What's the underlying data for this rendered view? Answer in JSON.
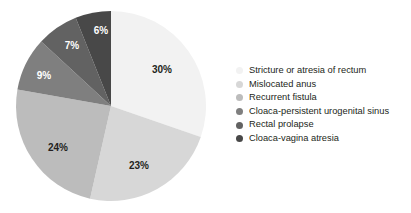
{
  "chart_data": {
    "type": "pie",
    "title": "",
    "subtitle": "",
    "xlabel": "",
    "ylabel": "",
    "legend_position": "right",
    "grid": false,
    "start_angle_deg": 0,
    "direction": "clockwise",
    "categories": [
      "Stricture or atresia of rectum",
      "Mislocated anus",
      "Recurrent fistula",
      "Cloaca-persistent urogenital sinus",
      "Rectal prolapse",
      "Cloaca-vagina atresia"
    ],
    "values": [
      30,
      23,
      24,
      9,
      7,
      6
    ],
    "value_labels": [
      "30%",
      "23%",
      "24%",
      "9%",
      "7%",
      "6%"
    ],
    "colors": [
      "#f2f2f2",
      "#d7d7d7",
      "#bcbcbc",
      "#7f7f7f",
      "#626262",
      "#484848"
    ],
    "label_colors": [
      "#231f20",
      "#231f20",
      "#231f20",
      "#ffffff",
      "#ffffff",
      "#ffffff"
    ],
    "units": "percent"
  },
  "pie": {
    "center_x": 111,
    "center_y": 106,
    "radius": 95,
    "slices": [
      {
        "label": "30%",
        "value": 30,
        "color": "#f2f2f2",
        "label_color": "#231f20",
        "label_x": 162,
        "label_y": 70
      },
      {
        "label": "23%",
        "value": 23,
        "color": "#d7d7d7",
        "label_color": "#231f20",
        "label_x": 139,
        "label_y": 166
      },
      {
        "label": "24%",
        "value": 24,
        "color": "#bcbcbc",
        "label_color": "#231f20",
        "label_x": 58,
        "label_y": 148
      },
      {
        "label": "9%",
        "value": 9,
        "color": "#7f7f7f",
        "label_color": "#ffffff",
        "label_x": 44,
        "label_y": 76
      },
      {
        "label": "7%",
        "value": 7,
        "color": "#626262",
        "label_color": "#ffffff",
        "label_x": 72,
        "label_y": 46
      },
      {
        "label": "6%",
        "value": 6,
        "color": "#484848",
        "label_color": "#ffffff",
        "label_x": 101,
        "label_y": 31
      }
    ]
  },
  "legend": {
    "items": [
      {
        "label": "Stricture or atresia of rectum",
        "color": "#f2f2f2"
      },
      {
        "label": "Mislocated anus",
        "color": "#d7d7d7"
      },
      {
        "label": "Recurrent fistula",
        "color": "#bcbcbc"
      },
      {
        "label": "Cloaca-persistent urogenital sinus",
        "color": "#7f7f7f"
      },
      {
        "label": "Rectal prolapse",
        "color": "#626262"
      },
      {
        "label": "Cloaca-vagina atresia",
        "color": "#484848"
      }
    ]
  }
}
